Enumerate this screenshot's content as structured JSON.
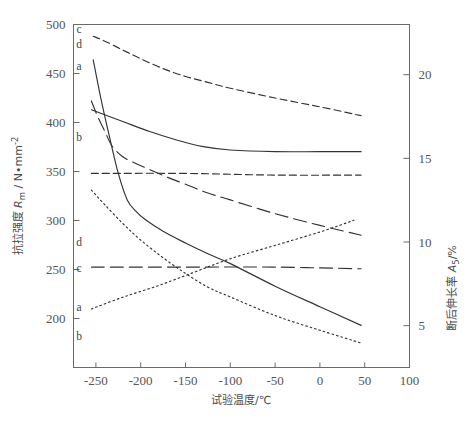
{
  "chart_data": {
    "type": "line",
    "title": "",
    "xlabel": "试验温度/℃",
    "ylabel_left": "抗拉强度 Rm / N•mm-2",
    "ylabel_right": "断后伸长率 A5 /%",
    "xlim": [
      -275,
      100
    ],
    "ylim_left": [
      150,
      500
    ],
    "ylim_right": [
      2.5,
      23
    ],
    "grid": false,
    "legend": "inline-curve-labels",
    "xticks": [
      -250,
      -200,
      -150,
      -100,
      -50,
      0,
      50,
      100
    ],
    "xtick_labels": [
      "-250",
      "-200",
      "-150",
      "-100",
      "-50",
      "0",
      "50",
      "100"
    ],
    "yticks_left": [
      200,
      250,
      300,
      350,
      400,
      450,
      500
    ],
    "ytick_labels_left": [
      "200",
      "250",
      "300",
      "350",
      "400",
      "450",
      "500"
    ],
    "yticks_right": [
      5,
      10,
      15,
      20
    ],
    "ytick_labels_right": [
      "5",
      "10",
      "15",
      "20"
    ],
    "series": [
      {
        "name": "c",
        "label": "c",
        "axis": "left",
        "quantity": "抗拉强度",
        "style": "dashed",
        "x": [
          -253,
          -240,
          -220,
          -200,
          -175,
          -150,
          -125,
          -100,
          -50,
          0,
          46
        ],
        "values": [
          488,
          483,
          474,
          465,
          455,
          447,
          441,
          435,
          425,
          416,
          407
        ]
      },
      {
        "name": "d",
        "label": "d",
        "axis": "left",
        "quantity": "抗拉强度",
        "style": "solid",
        "x": [
          -253,
          -245,
          -235,
          -225,
          -215,
          -205,
          -195,
          -175,
          -150,
          -125,
          -100,
          -50,
          0,
          46
        ],
        "values": [
          464,
          427,
          386,
          348,
          321,
          309,
          301,
          289,
          277,
          266,
          256,
          233,
          212,
          193
        ]
      },
      {
        "name": "a",
        "label": "a",
        "axis": "left",
        "quantity": "抗拉强度",
        "style": "longdash",
        "x": [
          -255,
          -248,
          -240,
          -232,
          -220,
          -205,
          -190,
          -170,
          -150,
          -125,
          -100,
          -50,
          0,
          46
        ],
        "values": [
          422,
          406,
          391,
          376,
          365,
          358,
          352,
          344,
          337,
          328,
          321,
          307,
          295,
          285
        ]
      },
      {
        "name": "b",
        "label": "b",
        "axis": "left",
        "quantity": "抗拉强度",
        "style": "dotted",
        "x": [
          -255,
          -240,
          -220,
          -200,
          -175,
          -150,
          -125,
          -100,
          -50,
          0,
          46
        ],
        "values": [
          331,
          316,
          297,
          280,
          262,
          246,
          232,
          222,
          203,
          188,
          175
        ]
      },
      {
        "name": "d2",
        "label": "d",
        "axis": "right",
        "quantity": "断后伸长率",
        "style": "solid",
        "x": [
          -255,
          -220,
          -190,
          -160,
          -130,
          -100,
          -50,
          0,
          46
        ],
        "values": [
          17.9,
          17.2,
          16.6,
          16.1,
          15.7,
          15.5,
          15.4,
          15.4,
          15.4
        ]
      },
      {
        "name": "c2",
        "label": "c",
        "axis": "right",
        "quantity": "断后伸长率",
        "style": "dashed",
        "x": [
          -255,
          -150,
          -50,
          46
        ],
        "values": [
          14.1,
          14.1,
          14.0,
          14.0
        ]
      },
      {
        "name": "a2",
        "label": "a",
        "axis": "right",
        "quantity": "断后伸长率",
        "style": "longdash",
        "x": [
          -255,
          -150,
          -50,
          46
        ],
        "values": [
          8.5,
          8.5,
          8.5,
          8.4
        ]
      },
      {
        "name": "b2",
        "label": "b",
        "axis": "right",
        "quantity": "断后伸长率",
        "style": "dotted",
        "x": [
          -255,
          -220,
          -180,
          -140,
          -100,
          -50,
          0,
          38
        ],
        "values": [
          6.0,
          6.7,
          7.4,
          8.2,
          9.0,
          9.8,
          10.6,
          11.3
        ]
      }
    ],
    "curve_labels_left_group": [
      {
        "label": "c",
        "x": 79,
        "y": 33
      },
      {
        "label": "d",
        "x": 79,
        "y": 48
      },
      {
        "label": "a",
        "x": 79,
        "y": 70
      },
      {
        "label": "b",
        "x": 79,
        "y": 141
      }
    ],
    "curve_labels_right_group": [
      {
        "label": "d",
        "x": 79,
        "y": 246
      },
      {
        "label": "c",
        "x": 79,
        "y": 272
      },
      {
        "label": "a",
        "x": 79,
        "y": 311
      },
      {
        "label": "b",
        "x": 79,
        "y": 340
      }
    ]
  },
  "axes": {
    "x_title": "试验温度/℃",
    "y_left_cn": "抗拉强度",
    "y_left_sym": "R",
    "y_left_sub": "m",
    "y_left_unit": "/ N•mm",
    "y_left_sup": "-2",
    "y_right_cn": "断后伸长率",
    "y_right_sym": "A",
    "y_right_sub": "5",
    "y_right_unit": "/%"
  },
  "colors": {
    "axis": "#555555",
    "curve": "#333333",
    "text": "#4a4a4a",
    "background": "#ffffff"
  }
}
